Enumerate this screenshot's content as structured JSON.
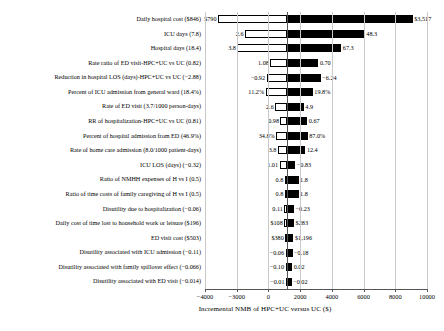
{
  "chart_data": {
    "type": "bar",
    "subtype": "tornado",
    "title": "",
    "xlabel": "Incremental NMB of HPC+UC versus UC ($)",
    "ylabel": "",
    "xlim": [
      -4000,
      10000
    ],
    "xticks": [
      -4000,
      -2000,
      0,
      2000,
      4000,
      6000,
      8000,
      10000
    ],
    "xticklabels": [
      "−4000",
      "−3000",
      "0",
      "2000",
      "4000",
      "6000",
      "8000",
      "10000"
    ],
    "grid": true,
    "grid_axis": "x",
    "legend": "none",
    "baseline": 1200,
    "colors": {
      "low_bar": "#ffffff",
      "high_bar": "#000000",
      "edge": "#000000",
      "grid": "#c9c9c9",
      "axis": "#555555"
    },
    "categories": [
      "Daily hospital cost ($846)",
      "ICU days (7.8)",
      "Hospital days (18.4)",
      "Rate ratio of ED visit-HPC+UC vs UC (0.82)",
      "Reduction in hospital LOS (days)-HPC+UC vs UC (−2.88)",
      "Percent of ICU admission from general ward (18.4%)",
      "Rate of ED visit (3.7/1000 person-days)",
      "RR of hospitalization-HPC+UC vs UC (0.81)",
      "Percent of hospital admission from ED (46.9%)",
      "Rate of home care admission (8.0/1000 patient-days)",
      "ICU LOS (days) (−0.32)",
      "Ratio of NMHH expenses of H vs I (0.5)",
      "Ratio of time costs of family caregiving of H vs I (0.5)",
      "Disutility due to hospitalization (−0.06)",
      "Daily cost of time lost to household work or leisure ($196)",
      "ED visit cost ($503)",
      "Disutility associated with ICU admission (−0.11)",
      "Disutility associated with family spillover effect (−0.066)",
      "Disutility associated with ED visit (−0.014)"
    ],
    "rows": [
      {
        "label": "Daily hospital cost ($846)",
        "low_value_label": "$790",
        "high_value_label": "$3,517",
        "low_nmb": -3180,
        "high_nmb": 9100
      },
      {
        "label": "ICU days (7.8)",
        "low_value_label": "2.6",
        "high_value_label": "48.3",
        "low_nmb": -1480,
        "high_nmb": 6080
      },
      {
        "label": "Hospital days (18.4)",
        "low_value_label": "3.8",
        "high_value_label": "67.3",
        "low_nmb": -1960,
        "high_nmb": 4600
      },
      {
        "label": "Rate ratio of ED visit-HPC+UC vs UC (0.82)",
        "low_value_label": "1.08",
        "high_value_label": "0.70",
        "low_nmb": 120,
        "high_nmb": 3150
      },
      {
        "label": "Reduction in hospital LOS (days)-HPC+UC vs UC (−2.88)",
        "low_value_label": "−0.92",
        "high_value_label": "−6.24",
        "low_nmb": -120,
        "high_nmb": 3300
      },
      {
        "label": "Percent of ICU admission from general ward (18.4%)",
        "low_value_label": "11.2%",
        "high_value_label": "19.8%",
        "low_nmb": -180,
        "high_nmb": 2800
      },
      {
        "label": "Rate of ED visit (3.7/1000 person-days)",
        "low_value_label": "2.6",
        "high_value_label": "4.9",
        "low_nmb": 430,
        "high_nmb": 2230
      },
      {
        "label": "RR of hospitalization-HPC+UC vs UC (0.81)",
        "low_value_label": "0.98",
        "high_value_label": "0.67",
        "low_nmb": 760,
        "high_nmb": 2450
      },
      {
        "label": "Percent of hospital admission from ED (46.9%)",
        "low_value_label": "34.8%",
        "high_value_label": "87.0%",
        "low_nmb": 490,
        "high_nmb": 2480
      },
      {
        "label": "Rate of home care admission (8.0/1000 patient-days)",
        "low_value_label": "3.8",
        "high_value_label": "12.4",
        "low_nmb": 600,
        "high_nmb": 2330
      },
      {
        "label": "ICU LOS (days) (−0.32)",
        "low_value_label": "1.01",
        "high_value_label": "−0.83",
        "low_nmb": 700,
        "high_nmb": 1700
      },
      {
        "label": "Ratio of NMHH expenses of H vs I (0.5)",
        "low_value_label": "0.8",
        "high_value_label": "1.8",
        "low_nmb": 1030,
        "high_nmb": 1900
      },
      {
        "label": "Ratio of time costs of family caregiving of H vs I (0.5)",
        "low_value_label": "0.8",
        "high_value_label": "1.8",
        "low_nmb": 1030,
        "high_nmb": 1900
      },
      {
        "label": "Disutility due to hospitalization (−0.06)",
        "low_value_label": "0.11",
        "high_value_label": "−0.23",
        "low_nmb": 1010,
        "high_nmb": 1620
      },
      {
        "label": "Daily cost of time lost to household work or leisure ($196)",
        "low_value_label": "$108",
        "high_value_label": "$283",
        "low_nmb": 1000,
        "high_nmb": 1620
      },
      {
        "label": "ED visit cost ($503)",
        "low_value_label": "$380",
        "high_value_label": "$1,196",
        "low_nmb": 1060,
        "high_nmb": 1580
      },
      {
        "label": "Disutility associated with ICU admission (−0.11)",
        "low_value_label": "−0.06",
        "high_value_label": "−0.18",
        "low_nmb": 1080,
        "high_nmb": 1520
      },
      {
        "label": "Disutility associated with family spillover effect (−0.066)",
        "low_value_label": "−0.10",
        "high_value_label": "0.02",
        "low_nmb": 1080,
        "high_nmb": 1500
      },
      {
        "label": "Disutility associated with ED visit (−0.014)",
        "low_value_label": "−0.01",
        "high_value_label": "−0.02",
        "low_nmb": 1110,
        "high_nmb": 1470
      }
    ]
  }
}
